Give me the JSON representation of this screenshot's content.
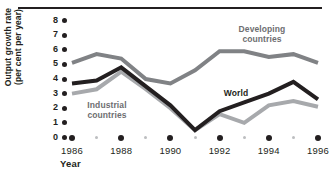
{
  "chart_data": {
    "type": "line",
    "title": "",
    "xlabel": "Year",
    "ylabel": "Output growth rate (per cent per year)",
    "ylabel_line1": "Output growth rate",
    "ylabel_line2": "(per cent per year)",
    "x": [
      1986,
      1987,
      1988,
      1989,
      1990,
      1991,
      1992,
      1993,
      1994,
      1995,
      1996
    ],
    "categories": [
      "1986",
      "1987",
      "1988",
      "1989",
      "1990",
      "1991",
      "1992",
      "1993",
      "1994",
      "1995",
      "1996"
    ],
    "xtick_labels": [
      "1986",
      "1988",
      "1990",
      "1992",
      "1994",
      "1996"
    ],
    "xtick_values": [
      1986,
      1988,
      1990,
      1992,
      1994,
      1996
    ],
    "ytick_labels": [
      "0",
      "1",
      "2",
      "3",
      "4",
      "5",
      "6",
      "7",
      "8"
    ],
    "ytick_values": [
      0,
      1,
      2,
      3,
      4,
      5,
      6,
      7,
      8
    ],
    "ylim": [
      0,
      8
    ],
    "xlim": [
      1985.5,
      1996.5
    ],
    "grid": false,
    "legend_position": "inline-annotations",
    "series": [
      {
        "name": "Developing countries",
        "label": "Developing countries",
        "label_line1": "Developing",
        "label_line2": "countries",
        "color": "#808285",
        "values": [
          5.1,
          5.7,
          5.4,
          4.0,
          3.7,
          4.6,
          5.9,
          5.9,
          5.5,
          5.7,
          5.1
        ]
      },
      {
        "name": "World",
        "label": "World",
        "label_line1": "World",
        "label_line2": "",
        "color": "#231f20",
        "values": [
          3.7,
          3.9,
          4.8,
          3.5,
          2.2,
          0.5,
          1.8,
          2.4,
          3.0,
          3.8,
          2.6
        ]
      },
      {
        "name": "Industrial countries",
        "label": "Industrial countries",
        "label_line1": "Industrial",
        "label_line2": "countries",
        "color": "#a7a9ac",
        "values": [
          3.0,
          3.3,
          4.5,
          3.3,
          2.0,
          0.5,
          1.6,
          1.0,
          2.2,
          2.5,
          2.1
        ]
      }
    ]
  },
  "axis": {
    "ytick_dot_color": "#231f20",
    "xtick_major_dot_color": "#231f20",
    "xtick_minor_dot_color": "#bcbec0"
  },
  "decor": {
    "top_rule_color": "#231f20"
  }
}
